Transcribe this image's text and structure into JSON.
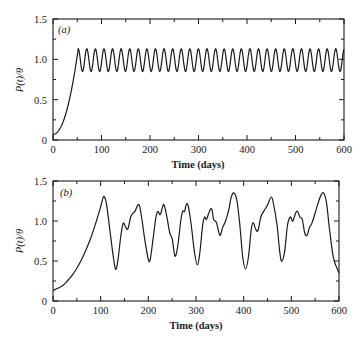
{
  "chart_data": [
    {
      "type": "line",
      "panel_label": "(a)",
      "title": "",
      "xlabel": "Time (days)",
      "ylabel": "P(t)/θ",
      "xlim": [
        0,
        600
      ],
      "ylim": [
        0,
        1.5
      ],
      "x_ticks": [
        "0",
        "100",
        "200",
        "300",
        "400",
        "500",
        "600"
      ],
      "y_ticks": [
        "0",
        "0.5",
        "1.0",
        "1.5"
      ],
      "grid": false,
      "description": "Rise from ~0.07 at t=0 to ~1.13 near t=50, then sustained regular oscillation between ~0.85 and ~1.13 with period ~17.7 days (~31 cycles) up to t=600",
      "series": [
        {
          "name": "P(t)/θ",
          "rise": [
            [
              0,
              0.07
            ],
            [
              10,
              0.15
            ],
            [
              20,
              0.3
            ],
            [
              30,
              0.52
            ],
            [
              40,
              0.8
            ],
            [
              48,
              1.05
            ],
            [
              52,
              1.13
            ]
          ],
          "oscillation": {
            "start": 52,
            "end": 600,
            "min": 0.85,
            "max": 1.13,
            "period": 17.7
          }
        }
      ]
    },
    {
      "type": "line",
      "panel_label": "(b)",
      "title": "",
      "xlabel": "Time (days)",
      "ylabel": "P(t)/θ",
      "xlim": [
        0,
        600
      ],
      "ylim": [
        0,
        1.5
      ],
      "x_ticks": [
        "0",
        "100",
        "200",
        "300",
        "400",
        "500",
        "600"
      ],
      "y_ticks": [
        "0",
        "0.5",
        "1.0",
        "1.5"
      ],
      "grid": false,
      "series": [
        {
          "name": "P(t)/θ",
          "points": [
            [
              0,
              0.13
            ],
            [
              10,
              0.16
            ],
            [
              20,
              0.19
            ],
            [
              30,
              0.25
            ],
            [
              40,
              0.32
            ],
            [
              50,
              0.41
            ],
            [
              60,
              0.52
            ],
            [
              70,
              0.65
            ],
            [
              80,
              0.8
            ],
            [
              90,
              0.98
            ],
            [
              100,
              1.18
            ],
            [
              105,
              1.29
            ],
            [
              108,
              1.3
            ],
            [
              112,
              1.22
            ],
            [
              118,
              0.95
            ],
            [
              125,
              0.62
            ],
            [
              131,
              0.4
            ],
            [
              136,
              0.5
            ],
            [
              142,
              0.8
            ],
            [
              147,
              0.97
            ],
            [
              152,
              0.93
            ],
            [
              157,
              0.9
            ],
            [
              163,
              1.05
            ],
            [
              168,
              1.1
            ],
            [
              172,
              1.12
            ],
            [
              178,
              1.2
            ],
            [
              182,
              1.18
            ],
            [
              187,
              1.0
            ],
            [
              193,
              0.75
            ],
            [
              200,
              0.52
            ],
            [
              204,
              0.52
            ],
            [
              210,
              0.78
            ],
            [
              216,
              1.05
            ],
            [
              220,
              1.12
            ],
            [
              225,
              1.08
            ],
            [
              230,
              1.18
            ],
            [
              233,
              1.2
            ],
            [
              238,
              1.08
            ],
            [
              245,
              0.85
            ],
            [
              250,
              0.78
            ],
            [
              256,
              0.56
            ],
            [
              262,
              0.7
            ],
            [
              268,
              1.0
            ],
            [
              272,
              1.12
            ],
            [
              276,
              1.12
            ],
            [
              280,
              1.21
            ],
            [
              284,
              1.18
            ],
            [
              290,
              0.95
            ],
            [
              297,
              0.6
            ],
            [
              303,
              0.45
            ],
            [
              308,
              0.6
            ],
            [
              314,
              0.95
            ],
            [
              318,
              1.05
            ],
            [
              322,
              1.02
            ],
            [
              328,
              1.12
            ],
            [
              333,
              1.15
            ],
            [
              337,
              1.02
            ],
            [
              343,
              0.98
            ],
            [
              350,
              0.82
            ],
            [
              356,
              0.92
            ],
            [
              362,
              1.0
            ],
            [
              368,
              1.12
            ],
            [
              374,
              1.3
            ],
            [
              380,
              1.35
            ],
            [
              386,
              1.25
            ],
            [
              392,
              0.95
            ],
            [
              398,
              0.55
            ],
            [
              404,
              0.4
            ],
            [
              410,
              0.55
            ],
            [
              416,
              0.9
            ],
            [
              420,
              0.98
            ],
            [
              425,
              0.9
            ],
            [
              430,
              0.88
            ],
            [
              436,
              1.05
            ],
            [
              442,
              1.12
            ],
            [
              450,
              1.2
            ],
            [
              458,
              1.3
            ],
            [
              463,
              1.2
            ],
            [
              470,
              0.95
            ],
            [
              476,
              0.6
            ],
            [
              480,
              0.5
            ],
            [
              486,
              0.62
            ],
            [
              492,
              0.95
            ],
            [
              498,
              1.05
            ],
            [
              503,
              1.0
            ],
            [
              509,
              1.1
            ],
            [
              513,
              1.12
            ],
            [
              518,
              1.05
            ],
            [
              523,
              1.02
            ],
            [
              528,
              0.85
            ],
            [
              533,
              0.82
            ],
            [
              538,
              0.92
            ],
            [
              543,
              0.97
            ],
            [
              550,
              1.1
            ],
            [
              556,
              1.22
            ],
            [
              562,
              1.32
            ],
            [
              568,
              1.35
            ],
            [
              574,
              1.22
            ],
            [
              580,
              0.9
            ],
            [
              588,
              0.55
            ],
            [
              595,
              0.42
            ],
            [
              600,
              0.35
            ]
          ]
        }
      ]
    }
  ],
  "panels": {
    "a": {
      "label": "(a)",
      "ylabel": "P(t)/θ",
      "xlabel": "Time (days)"
    },
    "b": {
      "label": "(b)",
      "ylabel": "P(t)/θ",
      "xlabel": "Time (days)"
    }
  },
  "x_tick_labels": [
    "0",
    "100",
    "200",
    "300",
    "400",
    "500",
    "600"
  ],
  "y_tick_labels": [
    "0",
    "0.5",
    "1.0",
    "1.5"
  ]
}
